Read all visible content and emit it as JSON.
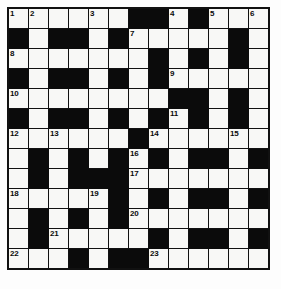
{
  "puzzle": {
    "type": "crossword-grid",
    "title": "Crossword Puzzle Grid",
    "rows": 13,
    "columns": 13,
    "colors": {
      "block": "#0b0b0b",
      "open": "#f8f8f6",
      "border": "#111111",
      "number_text": "#0a0a0a",
      "page_background": "#ffffff"
    },
    "clue_numbers_present": [
      1,
      2,
      3,
      4,
      5,
      6,
      7,
      8,
      9,
      10,
      11,
      12,
      13,
      14,
      15,
      16,
      17,
      18,
      19,
      20,
      21,
      22,
      23
    ],
    "legend": {
      "open_cell": "white fillable square",
      "block_cell": "black blocked square"
    },
    "grid": [
      [
        {
          "type": "open",
          "num": "1"
        },
        {
          "type": "open",
          "num": "2"
        },
        {
          "type": "open",
          "num": ""
        },
        {
          "type": "open",
          "num": ""
        },
        {
          "type": "open",
          "num": "3"
        },
        {
          "type": "open",
          "num": ""
        },
        {
          "type": "block",
          "num": ""
        },
        {
          "type": "block",
          "num": ""
        },
        {
          "type": "open",
          "num": "4"
        },
        {
          "type": "block",
          "num": ""
        },
        {
          "type": "open",
          "num": "5"
        },
        {
          "type": "open",
          "num": ""
        },
        {
          "type": "open",
          "num": "6"
        }
      ],
      [
        {
          "type": "block",
          "num": ""
        },
        {
          "type": "open",
          "num": ""
        },
        {
          "type": "block",
          "num": ""
        },
        {
          "type": "block",
          "num": ""
        },
        {
          "type": "open",
          "num": ""
        },
        {
          "type": "block",
          "num": ""
        },
        {
          "type": "open",
          "num": "7"
        },
        {
          "type": "open",
          "num": ""
        },
        {
          "type": "open",
          "num": ""
        },
        {
          "type": "open",
          "num": ""
        },
        {
          "type": "open",
          "num": ""
        },
        {
          "type": "block",
          "num": ""
        },
        {
          "type": "open",
          "num": ""
        }
      ],
      [
        {
          "type": "open",
          "num": "8"
        },
        {
          "type": "open",
          "num": ""
        },
        {
          "type": "open",
          "num": ""
        },
        {
          "type": "open",
          "num": ""
        },
        {
          "type": "open",
          "num": ""
        },
        {
          "type": "open",
          "num": ""
        },
        {
          "type": "open",
          "num": ""
        },
        {
          "type": "block",
          "num": ""
        },
        {
          "type": "open",
          "num": ""
        },
        {
          "type": "block",
          "num": ""
        },
        {
          "type": "open",
          "num": ""
        },
        {
          "type": "block",
          "num": ""
        },
        {
          "type": "open",
          "num": ""
        }
      ],
      [
        {
          "type": "block",
          "num": ""
        },
        {
          "type": "open",
          "num": ""
        },
        {
          "type": "block",
          "num": ""
        },
        {
          "type": "block",
          "num": ""
        },
        {
          "type": "open",
          "num": ""
        },
        {
          "type": "block",
          "num": ""
        },
        {
          "type": "open",
          "num": ""
        },
        {
          "type": "block",
          "num": ""
        },
        {
          "type": "open",
          "num": "9"
        },
        {
          "type": "open",
          "num": ""
        },
        {
          "type": "open",
          "num": ""
        },
        {
          "type": "open",
          "num": ""
        },
        {
          "type": "open",
          "num": ""
        }
      ],
      [
        {
          "type": "open",
          "num": "10"
        },
        {
          "type": "open",
          "num": ""
        },
        {
          "type": "open",
          "num": ""
        },
        {
          "type": "open",
          "num": ""
        },
        {
          "type": "open",
          "num": ""
        },
        {
          "type": "open",
          "num": ""
        },
        {
          "type": "open",
          "num": ""
        },
        {
          "type": "open",
          "num": ""
        },
        {
          "type": "block",
          "num": ""
        },
        {
          "type": "block",
          "num": ""
        },
        {
          "type": "open",
          "num": ""
        },
        {
          "type": "block",
          "num": ""
        },
        {
          "type": "open",
          "num": ""
        }
      ],
      [
        {
          "type": "block",
          "num": ""
        },
        {
          "type": "open",
          "num": ""
        },
        {
          "type": "block",
          "num": ""
        },
        {
          "type": "block",
          "num": ""
        },
        {
          "type": "open",
          "num": ""
        },
        {
          "type": "block",
          "num": ""
        },
        {
          "type": "open",
          "num": ""
        },
        {
          "type": "block",
          "num": ""
        },
        {
          "type": "open",
          "num": "11"
        },
        {
          "type": "block",
          "num": ""
        },
        {
          "type": "open",
          "num": ""
        },
        {
          "type": "block",
          "num": ""
        },
        {
          "type": "open",
          "num": ""
        }
      ],
      [
        {
          "type": "open",
          "num": "12"
        },
        {
          "type": "open",
          "num": ""
        },
        {
          "type": "open",
          "num": "13"
        },
        {
          "type": "open",
          "num": ""
        },
        {
          "type": "open",
          "num": ""
        },
        {
          "type": "open",
          "num": ""
        },
        {
          "type": "block",
          "num": ""
        },
        {
          "type": "open",
          "num": "14"
        },
        {
          "type": "open",
          "num": ""
        },
        {
          "type": "open",
          "num": ""
        },
        {
          "type": "open",
          "num": ""
        },
        {
          "type": "open",
          "num": "15"
        },
        {
          "type": "open",
          "num": ""
        }
      ],
      [
        {
          "type": "open",
          "num": ""
        },
        {
          "type": "block",
          "num": ""
        },
        {
          "type": "open",
          "num": ""
        },
        {
          "type": "block",
          "num": ""
        },
        {
          "type": "open",
          "num": ""
        },
        {
          "type": "block",
          "num": ""
        },
        {
          "type": "open",
          "num": "16"
        },
        {
          "type": "block",
          "num": ""
        },
        {
          "type": "open",
          "num": ""
        },
        {
          "type": "block",
          "num": ""
        },
        {
          "type": "block",
          "num": ""
        },
        {
          "type": "open",
          "num": ""
        },
        {
          "type": "block",
          "num": ""
        }
      ],
      [
        {
          "type": "open",
          "num": ""
        },
        {
          "type": "block",
          "num": ""
        },
        {
          "type": "open",
          "num": ""
        },
        {
          "type": "block",
          "num": ""
        },
        {
          "type": "block",
          "num": ""
        },
        {
          "type": "block",
          "num": ""
        },
        {
          "type": "open",
          "num": "17"
        },
        {
          "type": "open",
          "num": ""
        },
        {
          "type": "open",
          "num": ""
        },
        {
          "type": "open",
          "num": ""
        },
        {
          "type": "open",
          "num": ""
        },
        {
          "type": "open",
          "num": ""
        },
        {
          "type": "open",
          "num": ""
        }
      ],
      [
        {
          "type": "open",
          "num": "18"
        },
        {
          "type": "open",
          "num": ""
        },
        {
          "type": "open",
          "num": ""
        },
        {
          "type": "open",
          "num": ""
        },
        {
          "type": "open",
          "num": "19"
        },
        {
          "type": "block",
          "num": ""
        },
        {
          "type": "open",
          "num": ""
        },
        {
          "type": "block",
          "num": ""
        },
        {
          "type": "open",
          "num": ""
        },
        {
          "type": "block",
          "num": ""
        },
        {
          "type": "block",
          "num": ""
        },
        {
          "type": "open",
          "num": ""
        },
        {
          "type": "block",
          "num": ""
        }
      ],
      [
        {
          "type": "open",
          "num": ""
        },
        {
          "type": "block",
          "num": ""
        },
        {
          "type": "open",
          "num": ""
        },
        {
          "type": "block",
          "num": ""
        },
        {
          "type": "open",
          "num": ""
        },
        {
          "type": "block",
          "num": ""
        },
        {
          "type": "open",
          "num": "20"
        },
        {
          "type": "open",
          "num": ""
        },
        {
          "type": "open",
          "num": ""
        },
        {
          "type": "open",
          "num": ""
        },
        {
          "type": "open",
          "num": ""
        },
        {
          "type": "open",
          "num": ""
        },
        {
          "type": "open",
          "num": ""
        }
      ],
      [
        {
          "type": "open",
          "num": ""
        },
        {
          "type": "block",
          "num": ""
        },
        {
          "type": "open",
          "num": "21"
        },
        {
          "type": "open",
          "num": ""
        },
        {
          "type": "open",
          "num": ""
        },
        {
          "type": "open",
          "num": ""
        },
        {
          "type": "open",
          "num": ""
        },
        {
          "type": "block",
          "num": ""
        },
        {
          "type": "open",
          "num": ""
        },
        {
          "type": "block",
          "num": ""
        },
        {
          "type": "block",
          "num": ""
        },
        {
          "type": "open",
          "num": ""
        },
        {
          "type": "block",
          "num": ""
        }
      ],
      [
        {
          "type": "open",
          "num": "22"
        },
        {
          "type": "open",
          "num": ""
        },
        {
          "type": "open",
          "num": ""
        },
        {
          "type": "block",
          "num": ""
        },
        {
          "type": "open",
          "num": ""
        },
        {
          "type": "block",
          "num": ""
        },
        {
          "type": "block",
          "num": ""
        },
        {
          "type": "open",
          "num": "23"
        },
        {
          "type": "open",
          "num": ""
        },
        {
          "type": "open",
          "num": ""
        },
        {
          "type": "open",
          "num": ""
        },
        {
          "type": "open",
          "num": ""
        },
        {
          "type": "open",
          "num": ""
        }
      ]
    ]
  }
}
